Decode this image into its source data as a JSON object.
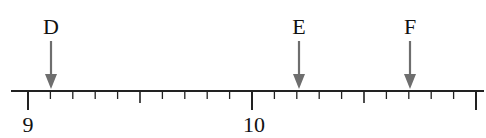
{
  "number_line": {
    "min": 9,
    "max": 11,
    "step": 0.1,
    "labeled_ticks": [
      {
        "value": 9,
        "label": "9"
      },
      {
        "value": 10,
        "label": "10"
      }
    ],
    "markers": [
      {
        "name": "D",
        "label": "D",
        "value": 9.1
      },
      {
        "name": "E",
        "label": "E",
        "value": 10.2
      },
      {
        "name": "F",
        "label": "F",
        "value": 10.7
      }
    ],
    "colors": {
      "axis": "#222222",
      "arrow": "#6e6e6e",
      "text": "#111111"
    }
  },
  "chart_data": {
    "type": "number_line",
    "title": "",
    "range": [
      9,
      11
    ],
    "tick_interval": 0.1,
    "tick_labels": [
      "9",
      "10"
    ],
    "points": [
      {
        "label": "D",
        "value": 9.1
      },
      {
        "label": "E",
        "value": 10.2
      },
      {
        "label": "F",
        "value": 10.7
      }
    ]
  }
}
